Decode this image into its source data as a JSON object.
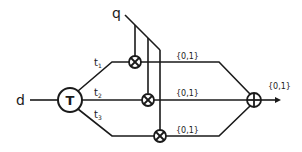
{
  "diagram": {
    "input_label": "d",
    "control_label": "q",
    "node_T_label": "T",
    "branches": [
      {
        "label": "t",
        "sub": "1",
        "output": "{0,1}"
      },
      {
        "label": "t",
        "sub": "2",
        "output": "{0,1}"
      },
      {
        "label": "t",
        "sub": "3",
        "output": "{0,1}"
      }
    ],
    "sum_output": "{0,1}",
    "colors": {
      "stroke": "#1a1a1a",
      "background": "#ffffff"
    }
  }
}
